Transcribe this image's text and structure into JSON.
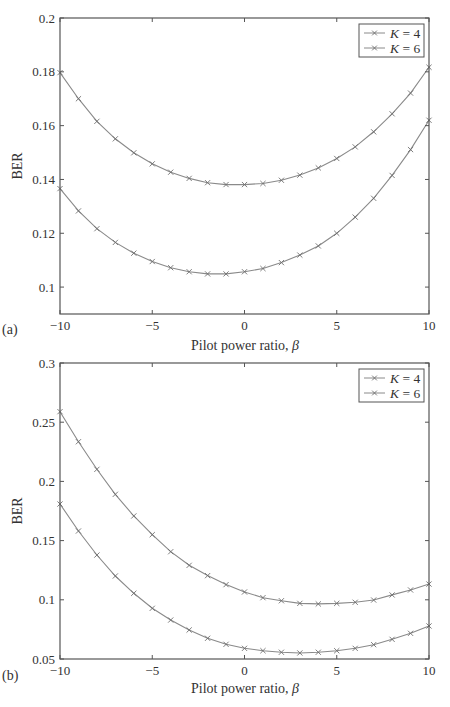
{
  "figure": {
    "panels": [
      {
        "label": "(a)",
        "xlabel": "Pilot power ratio, β",
        "ylabel": "BER"
      },
      {
        "label": "(b)",
        "xlabel": "Pilot power ratio, β",
        "ylabel": "BER"
      }
    ],
    "legend": [
      {
        "var": "K",
        "eq": " = 4"
      },
      {
        "var": "K",
        "eq": " = 6"
      }
    ],
    "colors": {
      "line": "#8a8a8a",
      "marker": "#6e6e6e",
      "axis": "#555555",
      "text": "#333333"
    }
  },
  "chart_data": [
    {
      "type": "line",
      "title": "",
      "panel_label": "(a)",
      "xlabel": "Pilot power ratio, β",
      "ylabel": "BER",
      "xlim": [
        -10,
        10
      ],
      "ylim": [
        0.09,
        0.2
      ],
      "xticks": [
        -10,
        -5,
        0,
        5,
        10
      ],
      "xtick_labels": [
        "−10",
        "−5",
        "0",
        "5",
        "10"
      ],
      "yticks": [
        0.1,
        0.12,
        0.14,
        0.16,
        0.18,
        0.2
      ],
      "ytick_labels": [
        "0.1",
        "0.12",
        "0.14",
        "0.16",
        "0.18",
        "0.2"
      ],
      "grid": false,
      "legend_position": "upper right",
      "x": [
        -10,
        -9,
        -8,
        -7,
        -6,
        -5,
        -4,
        -3,
        -2,
        -1,
        0,
        1,
        2,
        3,
        4,
        5,
        6,
        7,
        8,
        9,
        10
      ],
      "series": [
        {
          "name": "K = 4",
          "marker": "x",
          "values": [
            0.1797,
            0.17,
            0.1616,
            0.1551,
            0.1499,
            0.1458,
            0.1427,
            0.1404,
            0.1388,
            0.1381,
            0.1381,
            0.1385,
            0.1397,
            0.1416,
            0.1443,
            0.1478,
            0.1521,
            0.1577,
            0.1644,
            0.1721,
            0.1817
          ]
        },
        {
          "name": "K = 6",
          "marker": "x",
          "values": [
            0.1366,
            0.1283,
            0.1217,
            0.1166,
            0.1126,
            0.1095,
            0.1072,
            0.1057,
            0.1049,
            0.1049,
            0.1057,
            0.1069,
            0.1091,
            0.1119,
            0.1153,
            0.12,
            0.126,
            0.133,
            0.1415,
            0.1511,
            0.162
          ]
        }
      ]
    },
    {
      "type": "line",
      "title": "",
      "panel_label": "(b)",
      "xlabel": "Pilot power ratio, β",
      "ylabel": "BER",
      "xlim": [
        -10,
        10
      ],
      "ylim": [
        0.05,
        0.3
      ],
      "xticks": [
        -10,
        -5,
        0,
        5,
        10
      ],
      "xtick_labels": [
        "−10",
        "−5",
        "0",
        "5",
        "10"
      ],
      "yticks": [
        0.05,
        0.1,
        0.15,
        0.2,
        0.25,
        0.3
      ],
      "ytick_labels": [
        "0.05",
        "0.1",
        "0.15",
        "0.2",
        "0.25",
        "0.3"
      ],
      "grid": false,
      "legend_position": "upper right",
      "x": [
        -10,
        -9,
        -8,
        -7,
        -6,
        -5,
        -4,
        -3,
        -2,
        -1,
        0,
        1,
        2,
        3,
        4,
        5,
        6,
        7,
        8,
        9,
        10
      ],
      "series": [
        {
          "name": "K = 4",
          "marker": "x",
          "values": [
            0.2589,
            0.2335,
            0.2102,
            0.1891,
            0.1708,
            0.155,
            0.1406,
            0.1291,
            0.1204,
            0.1128,
            0.1066,
            0.1018,
            0.0992,
            0.097,
            0.0965,
            0.097,
            0.0979,
            0.0998,
            0.1041,
            0.1083,
            0.1133
          ]
        },
        {
          "name": "K = 6",
          "marker": "x",
          "values": [
            0.1809,
            0.1581,
            0.1378,
            0.1201,
            0.1055,
            0.0928,
            0.0829,
            0.0745,
            0.0675,
            0.0624,
            0.059,
            0.057,
            0.0557,
            0.0551,
            0.0557,
            0.057,
            0.059,
            0.0621,
            0.0666,
            0.0717,
            0.0779
          ]
        }
      ]
    }
  ]
}
